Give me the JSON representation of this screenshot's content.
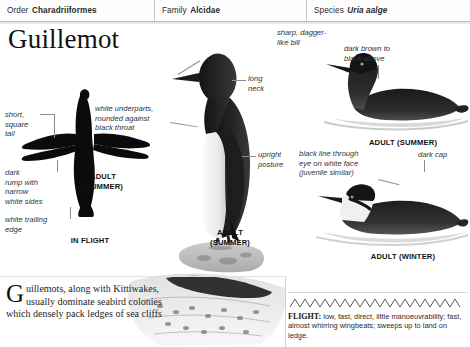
{
  "taxonomy": {
    "order_label": "Order",
    "order_value": "Charadriiformes",
    "family_label": "Family",
    "family_value": "Alcidae",
    "species_label": "Species",
    "species_value": "Uria aalge"
  },
  "title": "Guillemot",
  "annotations": {
    "short_square_tail": "short,\nsquare\ntail",
    "dark_rump": "dark\nrump with\nnarrow\nwhite sides",
    "white_trailing_edge": "white trailing\nedge",
    "white_underparts": "white underparts,\nrounded against\nblack throat",
    "sharp_bill": "sharp, dagger-\nlike bill",
    "long_neck": "long\nneck",
    "swims_low": "swims low",
    "upright_posture": "upright\nposture",
    "dark_brown_above": "dark brown to\nblack above",
    "black_line_eye": "black line through\neye on white face\n(juvenile similar)",
    "dark_cap": "dark cap"
  },
  "captions": {
    "flight_adult_summer": "ADULT\n(SUMMER)",
    "in_flight": "IN FLIGHT",
    "standing_adult_summer": "ADULT\n(SUMMER)",
    "swimming_adult_summer": "ADULT (SUMMER)",
    "adult_winter": "ADULT (WINTER)"
  },
  "intro": {
    "dropcap": "G",
    "text": "uillemots, along with Kittiwakes, usually dominate seabird colonies which densely pack ledges of sea cliffs"
  },
  "flight": {
    "label": "FLIGHT:",
    "text": " low, fast, direct, little manoeuvrability; fast, almost whirring wingbeats; sweeps up to land on ledge."
  },
  "colors": {
    "page_background": "#ffffff",
    "text": "#1a1a1a",
    "leader_line": "#8c8c8c",
    "rule": "#c4c4c4",
    "plumage_dark": "#111111",
    "plumage_light": "#f2f2f2"
  }
}
